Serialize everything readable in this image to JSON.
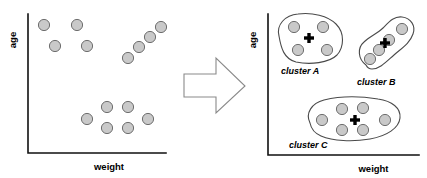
{
  "figure": {
    "background_color": "#ffffff",
    "point_fill_color": "#c9c9c9",
    "point_stroke_color": "#6e6e6e",
    "axis_color": "#111111",
    "blob_color": "#4a4a4a",
    "centroid_color": "#000000",
    "arrow_stroke_color": "#8a8a8a"
  },
  "left_panel": {
    "name": "unclustered-scatter-plot",
    "y_axis_label": "age",
    "x_axis_label": "weight",
    "axis": {
      "x0": 28,
      "y0": 153,
      "x_end": 166,
      "y_top": 14
    },
    "point_radius": 5.6,
    "groups": [
      {
        "name": "upper-left-group",
        "points": [
          {
            "x": 44,
            "y": 25
          },
          {
            "x": 77,
            "y": 25
          },
          {
            "x": 55,
            "y": 46
          },
          {
            "x": 87,
            "y": 46
          }
        ]
      },
      {
        "name": "diagonal-group",
        "points": [
          {
            "x": 128,
            "y": 58
          },
          {
            "x": 139,
            "y": 47
          },
          {
            "x": 150,
            "y": 37
          },
          {
            "x": 161,
            "y": 27
          }
        ]
      },
      {
        "name": "lower-middle-group",
        "points": [
          {
            "x": 87,
            "y": 119
          },
          {
            "x": 107,
            "y": 107
          },
          {
            "x": 128,
            "y": 107
          },
          {
            "x": 107,
            "y": 128
          },
          {
            "x": 128,
            "y": 128
          },
          {
            "x": 148,
            "y": 119
          }
        ]
      }
    ]
  },
  "arrow": {
    "name": "transformation-arrow",
    "points": "184,74 216,74 216,58 245,86 216,113 216,97 184,97"
  },
  "right_panel": {
    "name": "clustered-scatter-plot",
    "y_axis_label": "age",
    "x_axis_label": "weight",
    "axis": {
      "x0": 268,
      "y0": 155,
      "x_end": 419,
      "y_top": 14
    },
    "point_radius": 5.6,
    "clusters": [
      {
        "name": "cluster-a",
        "label": "cluster A",
        "label_x": 281,
        "label_y": 74,
        "blob_path": "M 279 36 C 276 25 285 15 298 14 C 312 12 328 16 336 24 C 345 33 344 47 337 55 C 329 63 310 65 296 62 C 284 59 281 48 279 36 Z",
        "centroid": {
          "x": 309,
          "y": 38
        },
        "points": [
          {
            "x": 294,
            "y": 27
          },
          {
            "x": 323,
            "y": 27
          },
          {
            "x": 298,
            "y": 50
          },
          {
            "x": 327,
            "y": 50
          }
        ]
      },
      {
        "name": "cluster-b",
        "label": "cluster B",
        "label_x": 357,
        "label_y": 85,
        "blob_path": "M 366 65 C 358 59 357 48 364 42 C 370 36 377 34 383 28 C 389 22 394 16 402 17 C 411 18 416 26 413 34 C 410 43 402 48 394 55 C 387 61 380 69 372 69 C 369 69 367 67 366 65 Z",
        "centroid": {
          "x": 385,
          "y": 43
        },
        "points": [
          {
            "x": 370,
            "y": 59
          },
          {
            "x": 379,
            "y": 50
          },
          {
            "x": 389,
            "y": 40
          },
          {
            "x": 402,
            "y": 29
          }
        ]
      },
      {
        "name": "cluster-c",
        "label": "cluster C",
        "label_x": 289,
        "label_y": 148,
        "blob_path": "M 310 123 C 305 113 312 103 324 100 C 340 96 360 96 378 99 C 392 101 401 108 400 118 C 399 128 387 136 370 139 C 352 142 333 141 321 136 C 314 133 311 128 310 123 Z",
        "centroid": {
          "x": 355,
          "y": 120
        },
        "points": [
          {
            "x": 322,
            "y": 120
          },
          {
            "x": 342,
            "y": 109
          },
          {
            "x": 363,
            "y": 108
          },
          {
            "x": 342,
            "y": 130
          },
          {
            "x": 363,
            "y": 130
          },
          {
            "x": 385,
            "y": 120
          }
        ]
      }
    ]
  }
}
